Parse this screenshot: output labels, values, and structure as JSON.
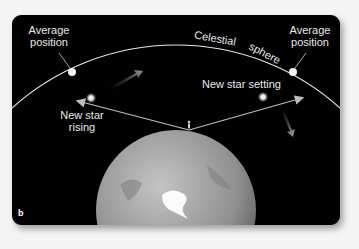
{
  "panel": {
    "letter": "b"
  },
  "labels": {
    "average_position_left_line1": "Average",
    "average_position_left_line2": "position",
    "average_position_right_line1": "Average",
    "average_position_right_line2": "position",
    "celestial_word1": "Celestial",
    "celestial_word2": "sphere",
    "new_star_setting": "New star setting",
    "new_star_rising_line1": "New star",
    "new_star_rising_line2": "rising"
  },
  "colors": {
    "background": "#000000",
    "sphere_line": "#e6e6e6",
    "arrow": "#bdbdbd",
    "earth": "#9a9a9a",
    "polar_ice": "#ffffff"
  }
}
